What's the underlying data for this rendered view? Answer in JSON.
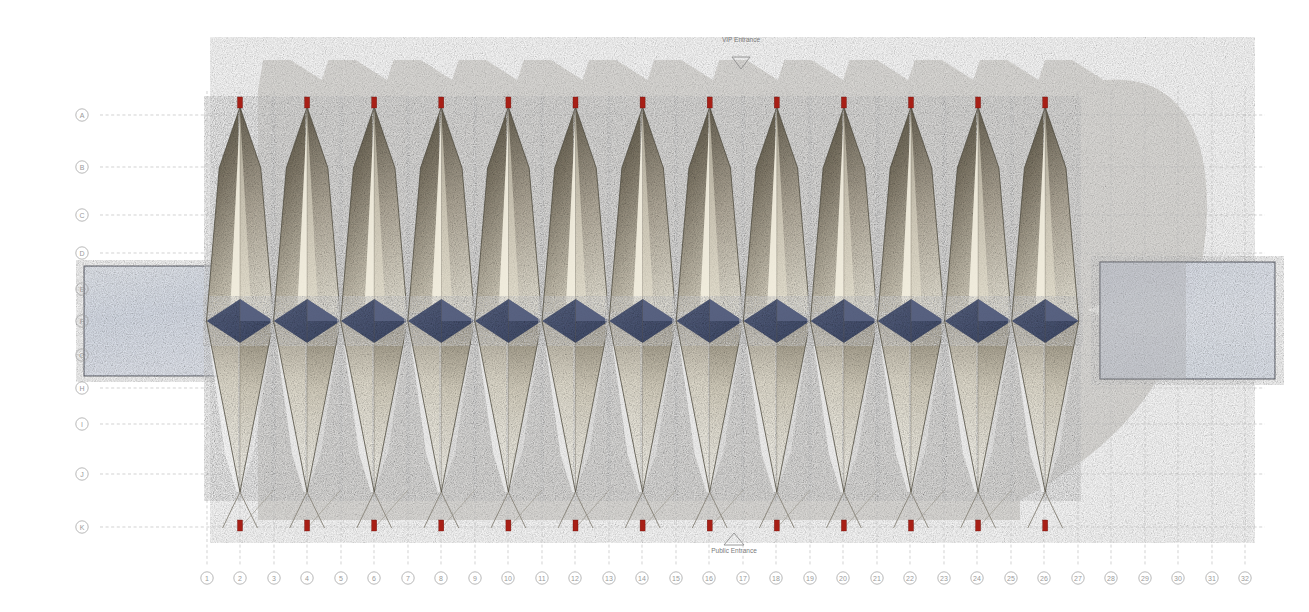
{
  "drawing": {
    "title": "Stadium Roof Elevation / Plan",
    "background": "#ffffff"
  },
  "grid": {
    "row_labels": [
      "A",
      "B",
      "C",
      "D",
      "E",
      "F",
      "G",
      "H",
      "I",
      "J",
      "K"
    ],
    "row_y": [
      115,
      167,
      215,
      253,
      289,
      321,
      355,
      388,
      424,
      474,
      527
    ],
    "col_labels": [
      "1",
      "2",
      "3",
      "4",
      "5",
      "6",
      "7",
      "8",
      "9",
      "10",
      "11",
      "12",
      "13",
      "14",
      "15",
      "16",
      "17",
      "18",
      "19",
      "20",
      "21",
      "22",
      "23",
      "24",
      "25",
      "26",
      "27",
      "28",
      "29",
      "30",
      "31",
      "32"
    ],
    "col_x": [
      207,
      240,
      274,
      307,
      341,
      374,
      408,
      441,
      475,
      508,
      542,
      575,
      609,
      642,
      676,
      709,
      743,
      776,
      810,
      843,
      877,
      910,
      944,
      977,
      1011,
      1044,
      1078,
      1111,
      1145,
      1178,
      1212,
      1245
    ],
    "label_row_x": 82,
    "label_col_y": 578,
    "line_color": "#b9b9b9",
    "label_color": "#9a9a9a"
  },
  "annotations": {
    "vip_entrance": {
      "label": "VIP Entrance",
      "x": 741,
      "text_y": 42,
      "marker": "triangle-down",
      "marker_y": 57
    },
    "public_entrance": {
      "label": "Public Entrance",
      "x": 734,
      "text_y": 553,
      "marker": "triangle-up",
      "marker_y": 533
    }
  },
  "colors": {
    "petal_dark": "#55503f",
    "petal_mid": "#a39a85",
    "petal_light": "#f6f3e6",
    "petal_cream": "#fefdf6",
    "petal_outline": "#4a4638",
    "diamond_blue": "#4c5878",
    "diamond_blue_light": "#6b7493",
    "marker_red": "#a81f16",
    "shadow_grey": "#d8d6d2",
    "water_blue": "#dfe4ef",
    "water_border": "#5c5f6b",
    "plaza_grey": "#b8b7bb"
  },
  "structure": {
    "petal_count": 13,
    "petal_apex_y": 107,
    "petal_widest_y": 321,
    "petal_tip_y": 492,
    "petal_foot_y": 528,
    "petal_first_center_x": 240,
    "petal_spacing": 67.1,
    "diamond_half_width": 33.5,
    "diamond_half_height": 22
  },
  "panels": {
    "left_water": {
      "x": 84,
      "y": 266,
      "w": 156,
      "h": 110
    },
    "right_water": {
      "x": 1100,
      "y": 262,
      "w": 175,
      "h": 117
    }
  },
  "markers": {
    "top_count": 13,
    "bottom_count": 13,
    "width": 5,
    "height": 11
  }
}
